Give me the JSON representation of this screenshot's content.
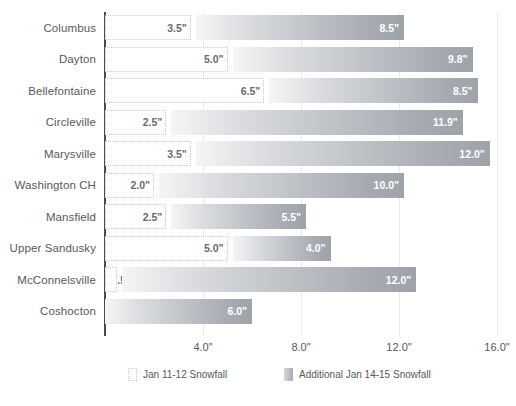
{
  "chart_data": {
    "type": "bar",
    "orientation": "horizontal",
    "stacked": true,
    "title": "",
    "xlabel": "",
    "ylabel": "",
    "xlim": [
      0,
      16
    ],
    "grid": true,
    "legend_position": "bottom",
    "categories": [
      "Columbus",
      "Dayton",
      "Bellefontaine",
      "Circleville",
      "Marysville",
      "Washington CH",
      "Mansfield",
      "Upper Sandusky",
      "McConnelsville",
      "Coshocton"
    ],
    "xticks": [
      "4.0\"",
      "8.0\"",
      "12.0\"",
      "16.0\""
    ],
    "xtick_values": [
      4,
      8,
      12,
      16
    ],
    "series": [
      {
        "name": "Jan 11-12 Snowfall",
        "style": "dotted-outline",
        "color": "#ffffff",
        "border_color": "#c9c9cb",
        "values": [
          3.5,
          5.0,
          6.5,
          2.5,
          3.5,
          2.0,
          2.5,
          5.0,
          0.5,
          0
        ],
        "labels": [
          "3.5\"",
          "5.0\"",
          "6.5\"",
          "2.5\"",
          "3.5\"",
          "2.0\"",
          "2.5\"",
          "5.0\"",
          ".5\"",
          ""
        ]
      },
      {
        "name": "Additional Jan 14-15 Snowfall",
        "style": "gray-gradient",
        "color": "#a7abb1",
        "values": [
          8.5,
          9.8,
          8.5,
          11.9,
          12.0,
          10.0,
          5.5,
          4.0,
          12.0,
          6.0
        ],
        "labels": [
          "8.5\"",
          "9.8\"",
          "8.5\"",
          "11.9\"",
          "12.0\"",
          "10.0\"",
          "5.5\"",
          "4.0\"",
          "12.0\"",
          "6.0\""
        ]
      }
    ],
    "rows": [
      {
        "category": "Columbus",
        "first": 3.5,
        "first_label": "3.5\"",
        "second": 8.5,
        "second_label": "8.5\""
      },
      {
        "category": "Dayton",
        "first": 5.0,
        "first_label": "5.0\"",
        "second": 9.8,
        "second_label": "9.8\""
      },
      {
        "category": "Bellefontaine",
        "first": 6.5,
        "first_label": "6.5\"",
        "second": 8.5,
        "second_label": "8.5\""
      },
      {
        "category": "Circleville",
        "first": 2.5,
        "first_label": "2.5\"",
        "second": 11.9,
        "second_label": "11.9\""
      },
      {
        "category": "Marysville",
        "first": 3.5,
        "first_label": "3.5\"",
        "second": 12.0,
        "second_label": "12.0\""
      },
      {
        "category": "Washington CH",
        "first": 2.0,
        "first_label": "2.0\"",
        "second": 10.0,
        "second_label": "10.0\""
      },
      {
        "category": "Mansfield",
        "first": 2.5,
        "first_label": "2.5\"",
        "second": 5.5,
        "second_label": "5.5\""
      },
      {
        "category": "Upper Sandusky",
        "first": 5.0,
        "first_label": "5.0\"",
        "second": 4.0,
        "second_label": "4.0\""
      },
      {
        "category": "McConnelsville",
        "first": 0.5,
        "first_label": ".5\"",
        "second": 12.0,
        "second_label": "12.0\""
      },
      {
        "category": "Coshocton",
        "first": 0,
        "first_label": "",
        "second": 6.0,
        "second_label": "6.0\""
      }
    ],
    "legend": [
      {
        "label": "Jan 11-12 Snowfall",
        "swatch": "dotted-outline"
      },
      {
        "label": "Additional Jan 14-15 Snowfall",
        "swatch": "gray-gradient"
      }
    ]
  }
}
